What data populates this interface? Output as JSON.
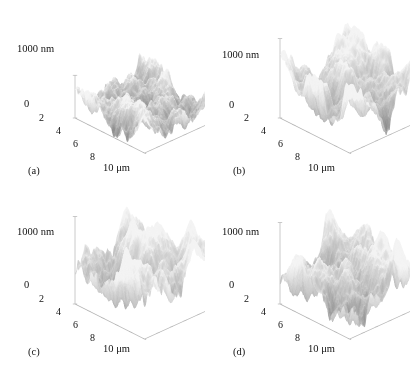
{
  "figure": {
    "background": "#ffffff",
    "ink": "#121212",
    "axis_line_color": "#b4b4b4",
    "rows": 2,
    "cols": 2
  },
  "chart_data": {
    "type": "surface-3d-grid",
    "title": "",
    "subtitle": "",
    "colormap": "grayscale",
    "shared_axes": {
      "zlabel": "1000 nm",
      "zmin_label": "0",
      "zlim": [
        0,
        1000
      ],
      "z_units": "nm",
      "xlim": [
        0,
        10
      ],
      "x_units": "μm",
      "xticks": [
        "2",
        "4",
        "6",
        "8"
      ],
      "x_end_label": "10 μm",
      "grid": false,
      "legend": null
    },
    "panels": [
      {
        "id": "a",
        "label": "(a)",
        "zlabel": "1000 nm",
        "zmin_label": "0",
        "xticks": [
          "2",
          "4",
          "6",
          "8"
        ],
        "x_end_label": "10 μm",
        "roughness": "fine-grained, low amplitude, dense small asperities",
        "seed": 11,
        "amplitude": 0.42,
        "feature_scale": 2.1,
        "octaves": 6,
        "spike": 0.95,
        "tilt": 0.04
      },
      {
        "id": "b",
        "label": "(b)",
        "zlabel": "1000 nm",
        "zmin_label": "0",
        "xticks": [
          "2",
          "4",
          "6",
          "8"
        ],
        "x_end_label": "10 μm",
        "roughness": "coarse-grained, high amplitude, large clustered mounds",
        "seed": 27,
        "amplitude": 0.78,
        "feature_scale": 1.25,
        "octaves": 6,
        "spike": 0.72,
        "tilt": 0.02
      },
      {
        "id": "c",
        "label": "(c)",
        "zlabel": "1000 nm",
        "zmin_label": "0",
        "xticks": [
          "2",
          "4",
          "6",
          "8"
        ],
        "x_end_label": "10 μm",
        "roughness": "medium-coarse, tall central ridge, broad mounds",
        "seed": 43,
        "amplitude": 0.86,
        "feature_scale": 1.15,
        "octaves": 6,
        "spike": 0.68,
        "tilt": 0.03
      },
      {
        "id": "d",
        "label": "(d)",
        "zlabel": "1000 nm",
        "zmin_label": "0",
        "xticks": [
          "2",
          "4",
          "6",
          "8"
        ],
        "x_end_label": "10 μm",
        "roughness": "coarse, high amplitude, elongated ridges",
        "seed": 61,
        "amplitude": 0.8,
        "feature_scale": 1.3,
        "octaves": 6,
        "spike": 0.7,
        "tilt": 0.02
      }
    ]
  }
}
